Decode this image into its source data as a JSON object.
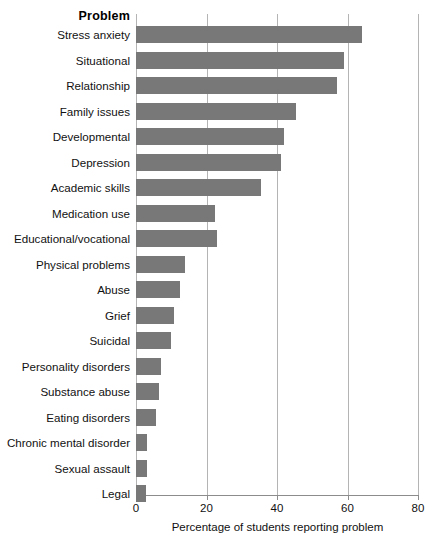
{
  "chart_data": {
    "type": "bar",
    "orientation": "horizontal",
    "title": "",
    "category_axis_heading": "Problem",
    "xlabel": "Percentage of students reporting problem",
    "ylabel": "",
    "xlim": [
      0,
      80
    ],
    "xticks": [
      0,
      20,
      40,
      60,
      80
    ],
    "xtick_labels": [
      "0",
      "20",
      "40",
      "60",
      "80"
    ],
    "grid": "vertical",
    "legend": "none",
    "bar_color": "#787878",
    "gridline_color": "#b4b4b4",
    "axis_color": "#8c8c8c",
    "categories": [
      "Stress anxiety",
      "Situational",
      "Relationship",
      "Family issues",
      "Developmental",
      "Depression",
      "Academic skills",
      "Medication use",
      "Educational/vocational",
      "Physical problems",
      "Abuse",
      "Grief",
      "Suicidal",
      "Personality disorders",
      "Substance abuse",
      "Eating disorders",
      "Chronic mental disorder",
      "Sexual assault",
      "Legal"
    ],
    "values": [
      64,
      59,
      57,
      45.5,
      42,
      41,
      35.5,
      22.5,
      23,
      14,
      12.5,
      10.7,
      10,
      7,
      6.5,
      5.7,
      3.2,
      3.2,
      2.8
    ]
  }
}
